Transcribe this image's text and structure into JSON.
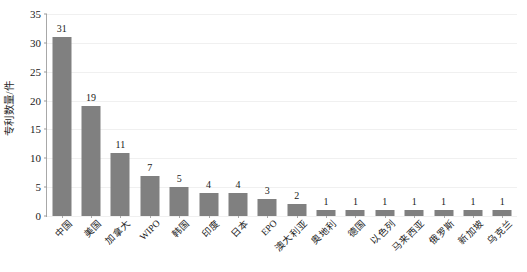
{
  "chart_data": {
    "type": "bar",
    "title": "",
    "subtitle": "",
    "xlabel": "",
    "ylabel": "专利数量/件",
    "ylim": [
      0,
      35
    ],
    "ytick_step": 5,
    "yticks": [
      0,
      5,
      10,
      15,
      20,
      25,
      30,
      35
    ],
    "grid": true,
    "legend": false,
    "legend_position": "none",
    "categories": [
      "中国",
      "美国",
      "加拿大",
      "WIPO",
      "韩国",
      "印度",
      "日本",
      "EPO",
      "澳大利亚",
      "奥地利",
      "德国",
      "以色列",
      "马来西亚",
      "俄罗斯",
      "新加坡",
      "乌克兰"
    ],
    "values": [
      31,
      19,
      11,
      7,
      5,
      4,
      4,
      3,
      2,
      1,
      1,
      1,
      1,
      1,
      1,
      1
    ],
    "data_labels": [
      "31",
      "19",
      "11",
      "7",
      "5",
      "4",
      "4",
      "3",
      "2",
      "1",
      "1",
      "1",
      "1",
      "1",
      "1",
      "1"
    ],
    "bar_color": "#808080",
    "background_color": "#ffffff",
    "axis_color": "#a8a8a8",
    "gridline_color": "#f0f0f0",
    "text_color": "#1a1a1a"
  }
}
